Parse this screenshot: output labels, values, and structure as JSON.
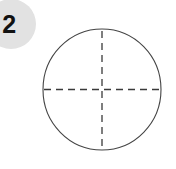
{
  "figure": {
    "label": "2",
    "badge": {
      "text": "2",
      "fill_color": "#e2e2e2",
      "text_color": "#111111",
      "center_x": 11,
      "center_y": 24,
      "radius": 25
    },
    "background_color": "#ffffff",
    "stroke_color": "#444444",
    "shapes": [
      {
        "name": "outer-circle",
        "type": "ellipse",
        "center_x": 102,
        "center_y": 89.5,
        "radius_x": 59,
        "radius_y": 60.5,
        "stroke_width": 1.1,
        "fill": "none",
        "dashed": false
      },
      {
        "name": "vertical-center-line",
        "type": "line",
        "x1": 102,
        "y1": 31,
        "x2": 102,
        "y2": 148,
        "stroke_width": 1.3,
        "dashed": true,
        "dash_pattern": "7 5"
      },
      {
        "name": "horizontal-center-line",
        "type": "line",
        "x1": 44,
        "y1": 89.5,
        "x2": 160,
        "y2": 89.5,
        "stroke_width": 1.3,
        "dashed": true,
        "dash_pattern": "7 5"
      }
    ]
  }
}
